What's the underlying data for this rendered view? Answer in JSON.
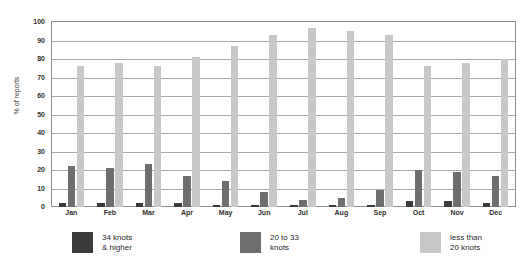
{
  "chart_data": {
    "type": "bar",
    "xlabel": "",
    "ylabel": "% of reports",
    "ylim": [
      0,
      100
    ],
    "ytick_step": 10,
    "yticks": [
      100,
      90,
      80,
      70,
      60,
      50,
      40,
      30,
      20,
      10,
      0
    ],
    "grid": true,
    "legend_position": "bottom",
    "categories": [
      "Jan",
      "Feb",
      "Mar",
      "Apr",
      "May",
      "Jun",
      "Jul",
      "Aug",
      "Sep",
      "Oct",
      "Nov",
      "Dec"
    ],
    "series": [
      {
        "name": "34 knots & higher",
        "color": "#3a3a3a",
        "values": [
          2,
          2,
          2,
          2,
          1,
          1,
          1,
          1,
          1,
          3,
          3,
          2
        ]
      },
      {
        "name": "20 to 33 knots",
        "color": "#6e6e6e",
        "values": [
          22,
          21,
          23,
          17,
          14,
          8,
          4,
          5,
          9,
          20,
          19,
          17
        ]
      },
      {
        "name": "less than 20 knots",
        "color": "#c8c8c8",
        "values": [
          76,
          78,
          76,
          81,
          87,
          93,
          97,
          95,
          93,
          76,
          78,
          80
        ]
      }
    ]
  },
  "legend": {
    "items": [
      {
        "label": "34 knots\n& higher",
        "swatch": "s0"
      },
      {
        "label": "20 to 33\nknots",
        "swatch": "s1"
      },
      {
        "label": "less than\n20 knots",
        "swatch": "s2"
      }
    ]
  }
}
